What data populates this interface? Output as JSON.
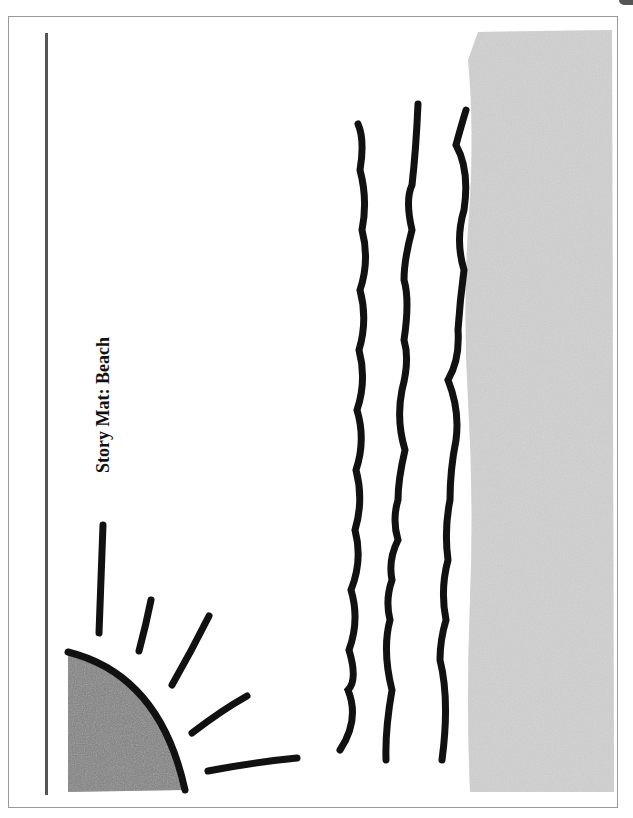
{
  "page": {
    "title": "Story Mat: Beach"
  },
  "illustration": {
    "elements": [
      "sun",
      "sun-rays",
      "waves",
      "sand"
    ],
    "colors": {
      "ink": "#111111",
      "sun_fill": "#7a7a7a",
      "sand_fill": "#c8c8c8",
      "border": "#9a9a9a"
    }
  }
}
